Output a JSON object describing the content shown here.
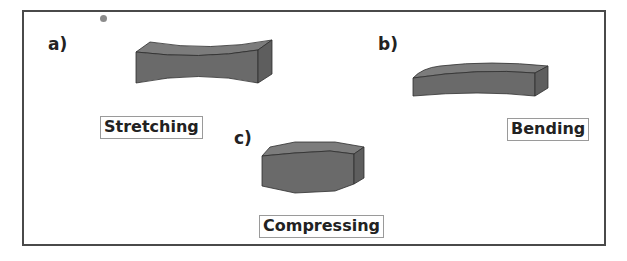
{
  "figure": {
    "frame_color": "#4a4a4a",
    "shape_colors": {
      "front_face": "#6a6a6a",
      "top_face": "#7c7c7c",
      "side_face": "#5e5e5e",
      "edge": "#2e2e2e"
    },
    "panels": [
      {
        "id": "a",
        "label": "a)",
        "caption": "Stretching",
        "shape": "block-concave-waist"
      },
      {
        "id": "b",
        "label": "b)",
        "caption": "Bending",
        "shape": "block-curved-arc"
      },
      {
        "id": "c",
        "label": "c)",
        "caption": "Compressing",
        "shape": "block-bulged"
      }
    ]
  }
}
